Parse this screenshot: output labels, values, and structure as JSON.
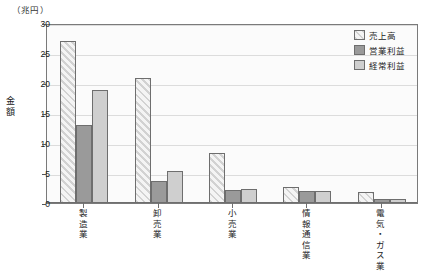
{
  "unit_label": "（兆円）",
  "yaxis_title_chars": [
    "金",
    "額"
  ],
  "legend": {
    "items": [
      {
        "label": "売上高",
        "swatch": "diagonal-hatch-swatch"
      },
      {
        "label": "営業利益",
        "swatch": "dark-gray-swatch"
      },
      {
        "label": "経常利益",
        "swatch": "light-gray-swatch"
      }
    ]
  },
  "chart_data": {
    "type": "bar",
    "title": "",
    "xlabel": "",
    "ylabel": "金額",
    "unit": "兆円",
    "ylim": [
      0,
      30
    ],
    "yticks": [
      0,
      5,
      10,
      15,
      20,
      25,
      30
    ],
    "ytick_labels": [
      "0",
      "5",
      "10",
      "15",
      "20",
      "25",
      "30"
    ],
    "grid": true,
    "legend_position": "top-right",
    "categories": [
      "製造業",
      "卸売業",
      "小売業",
      "情報通信業",
      "電気・ガス業"
    ],
    "category_chars": [
      [
        "製",
        "造",
        "業"
      ],
      [
        "卸",
        "売",
        "業"
      ],
      [
        "小",
        "売",
        "業"
      ],
      [
        "情",
        "報",
        "通",
        "信",
        "業"
      ],
      [
        "電",
        "気",
        "・",
        "ガ",
        "ス",
        "業"
      ]
    ],
    "series": [
      {
        "name": "売上高",
        "values": [
          27.0,
          20.8,
          8.4,
          2.7,
          1.9
        ],
        "fill": "diagonal-hatch"
      },
      {
        "name": "営業利益",
        "values": [
          13.0,
          3.6,
          2.2,
          2.0,
          0.7
        ],
        "fill": "#9a9a9a"
      },
      {
        "name": "経常利益",
        "values": [
          18.8,
          5.3,
          2.3,
          2.0,
          0.6
        ],
        "fill": "#cfcfcf"
      }
    ]
  }
}
